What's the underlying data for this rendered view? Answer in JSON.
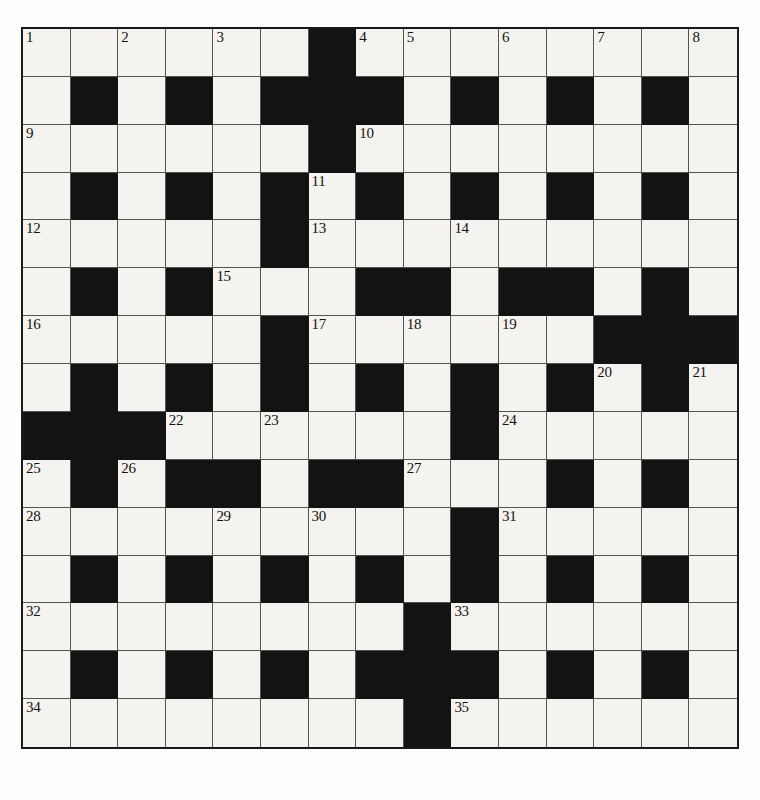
{
  "puzzle": {
    "type": "crossword-grid",
    "rows": 15,
    "cols": 15,
    "cell_size_px": 47.7,
    "colors": {
      "block": "#131313",
      "cell": "#f4f3ef",
      "grid_line": "#55544f",
      "border": "#1a1a1a",
      "number_text": "#15120f",
      "page_background": "#fdfdfb"
    },
    "legend": {
      "0": "white (fillable) square",
      "1": "black (blocked) square"
    },
    "blocks": [
      [
        0,
        0,
        0,
        0,
        0,
        0,
        1,
        0,
        0,
        0,
        0,
        0,
        0,
        0,
        0
      ],
      [
        0,
        1,
        0,
        1,
        0,
        1,
        1,
        1,
        0,
        1,
        0,
        1,
        0,
        1,
        0
      ],
      [
        0,
        0,
        0,
        0,
        0,
        0,
        1,
        0,
        0,
        0,
        0,
        0,
        0,
        0,
        0
      ],
      [
        0,
        1,
        0,
        1,
        0,
        1,
        0,
        1,
        0,
        1,
        0,
        1,
        0,
        1,
        0
      ],
      [
        0,
        0,
        0,
        0,
        0,
        1,
        0,
        0,
        0,
        0,
        0,
        0,
        0,
        0,
        0
      ],
      [
        0,
        1,
        0,
        1,
        0,
        0,
        0,
        1,
        1,
        0,
        1,
        1,
        0,
        1,
        0
      ],
      [
        0,
        0,
        0,
        0,
        0,
        1,
        0,
        0,
        0,
        0,
        0,
        0,
        1,
        1,
        1
      ],
      [
        0,
        1,
        0,
        1,
        0,
        1,
        0,
        1,
        0,
        1,
        0,
        1,
        0,
        1,
        0
      ],
      [
        1,
        1,
        1,
        0,
        0,
        0,
        0,
        0,
        0,
        1,
        0,
        0,
        0,
        0,
        0
      ],
      [
        0,
        1,
        0,
        1,
        1,
        0,
        1,
        1,
        0,
        0,
        0,
        1,
        0,
        1,
        0
      ],
      [
        0,
        0,
        0,
        0,
        0,
        0,
        0,
        0,
        0,
        1,
        0,
        0,
        0,
        0,
        0
      ],
      [
        0,
        1,
        0,
        1,
        0,
        1,
        0,
        1,
        0,
        1,
        0,
        1,
        0,
        1,
        0
      ],
      [
        0,
        0,
        0,
        0,
        0,
        0,
        0,
        0,
        1,
        0,
        0,
        0,
        0,
        0,
        0
      ],
      [
        0,
        1,
        0,
        1,
        0,
        1,
        0,
        1,
        1,
        1,
        0,
        1,
        0,
        1,
        0
      ],
      [
        0,
        0,
        0,
        0,
        0,
        0,
        0,
        0,
        1,
        0,
        0,
        0,
        0,
        0,
        0
      ]
    ],
    "numbers": [
      {
        "row": 0,
        "col": 0,
        "label": "1"
      },
      {
        "row": 0,
        "col": 2,
        "label": "2"
      },
      {
        "row": 0,
        "col": 4,
        "label": "3"
      },
      {
        "row": 0,
        "col": 7,
        "label": "4"
      },
      {
        "row": 0,
        "col": 8,
        "label": "5"
      },
      {
        "row": 0,
        "col": 10,
        "label": "6"
      },
      {
        "row": 0,
        "col": 12,
        "label": "7"
      },
      {
        "row": 0,
        "col": 14,
        "label": "8"
      },
      {
        "row": 2,
        "col": 0,
        "label": "9"
      },
      {
        "row": 2,
        "col": 7,
        "label": "10"
      },
      {
        "row": 3,
        "col": 6,
        "label": "11"
      },
      {
        "row": 4,
        "col": 0,
        "label": "12"
      },
      {
        "row": 4,
        "col": 6,
        "label": "13"
      },
      {
        "row": 4,
        "col": 9,
        "label": "14"
      },
      {
        "row": 5,
        "col": 4,
        "label": "15"
      },
      {
        "row": 6,
        "col": 0,
        "label": "16"
      },
      {
        "row": 6,
        "col": 6,
        "label": "17"
      },
      {
        "row": 6,
        "col": 8,
        "label": "18"
      },
      {
        "row": 6,
        "col": 10,
        "label": "19"
      },
      {
        "row": 7,
        "col": 12,
        "label": "20"
      },
      {
        "row": 7,
        "col": 14,
        "label": "21"
      },
      {
        "row": 8,
        "col": 3,
        "label": "22"
      },
      {
        "row": 8,
        "col": 5,
        "label": "23"
      },
      {
        "row": 8,
        "col": 10,
        "label": "24"
      },
      {
        "row": 9,
        "col": 0,
        "label": "25"
      },
      {
        "row": 9,
        "col": 2,
        "label": "26"
      },
      {
        "row": 9,
        "col": 8,
        "label": "27"
      },
      {
        "row": 10,
        "col": 0,
        "label": "28"
      },
      {
        "row": 10,
        "col": 4,
        "label": "29"
      },
      {
        "row": 10,
        "col": 6,
        "label": "30"
      },
      {
        "row": 10,
        "col": 10,
        "label": "31"
      },
      {
        "row": 12,
        "col": 0,
        "label": "32"
      },
      {
        "row": 12,
        "col": 9,
        "label": "33"
      },
      {
        "row": 14,
        "col": 0,
        "label": "34"
      },
      {
        "row": 14,
        "col": 9,
        "label": "35"
      }
    ]
  }
}
